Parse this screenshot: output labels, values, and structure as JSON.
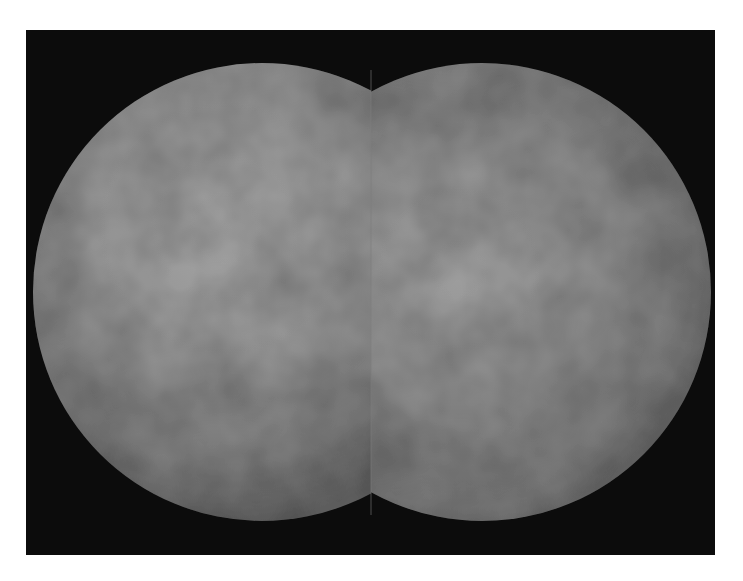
{
  "figure": {
    "background": "#ffffff",
    "frame": {
      "x": 26,
      "y": 30,
      "width": 689,
      "height": 525,
      "color": "#0c0c0c"
    },
    "discs": [
      {
        "name": "left-hemisphere",
        "cx": 262,
        "cy": 292,
        "r": 229,
        "clip": "left-of-seam",
        "base_color": "#8a8a8a",
        "highlight_color": "#a2a2a2",
        "highlight_center": [
          0.42,
          0.36
        ],
        "edge_color": "#5a5a5a"
      },
      {
        "name": "right-hemisphere",
        "cx": 482,
        "cy": 292,
        "r": 229,
        "clip": "right-of-seam",
        "base_color": "#858585",
        "highlight_color": "#9c9c9c",
        "highlight_center": [
          0.45,
          0.45
        ],
        "edge_color": "#565656"
      }
    ],
    "seam_x": 371
  }
}
